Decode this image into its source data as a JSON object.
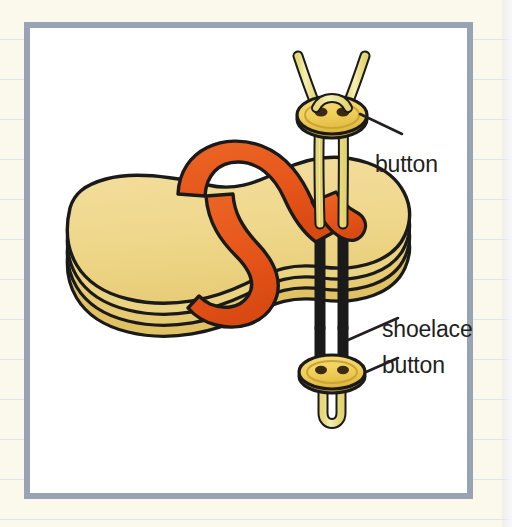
{
  "figure": {
    "kind": "labeled-diagram",
    "frame": {
      "border_color": "#9aa3b4",
      "panel_color": "#ffffff"
    },
    "background": {
      "paper_color": "#fbf9ec",
      "rule_line_color": "#d9e2ee"
    },
    "palette": {
      "sole_top": "#efd88c",
      "sole_edge": "#e3c96f",
      "sole_shadow": "#d6b94f",
      "strap_orange": "#e6551a",
      "strap_orange_dark": "#c8430f",
      "lace_yellow": "#efe58c",
      "lace_highlight": "#f7f2bd",
      "button_yellow": "#f0cf5a",
      "button_shadow": "#d9b13a",
      "outline": "#1a1a1a",
      "hole_dark": "#3b2a12"
    },
    "labels": [
      {
        "id": "button-top",
        "text": "button"
      },
      {
        "id": "shoelace",
        "text": "shoelace"
      },
      {
        "id": "button-bottom",
        "text": "button"
      }
    ],
    "parts": [
      {
        "id": "sole",
        "name": "stacked sole layers",
        "count": 4
      },
      {
        "id": "strap",
        "name": "orange toe strap"
      },
      {
        "id": "lace",
        "name": "shoelace"
      },
      {
        "id": "button-upper",
        "name": "upper button",
        "holes": 2
      },
      {
        "id": "button-lower",
        "name": "lower button",
        "holes": 2
      }
    ]
  }
}
